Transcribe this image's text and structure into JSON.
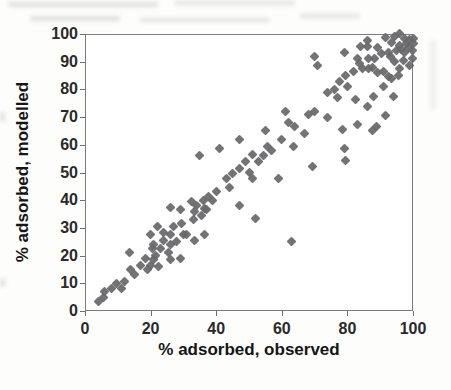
{
  "figure": {
    "kind": "scanned scatter chart"
  },
  "chart_data": {
    "type": "scatter",
    "title": "",
    "xlabel": "% adsorbed, observed",
    "ylabel": "% adsorbed, modelled",
    "xlim": [
      0,
      100
    ],
    "ylim": [
      0,
      100
    ],
    "x_ticks": [
      0,
      20,
      40,
      60,
      80,
      100
    ],
    "y_ticks": [
      0,
      10,
      20,
      30,
      40,
      50,
      60,
      70,
      80,
      90,
      100
    ],
    "grid": false,
    "legend": false,
    "marker": "diamond",
    "marker_color": "#68686c",
    "axis_color": "#6f6f6f",
    "points": [
      [
        4,
        3.5
      ],
      [
        5.5,
        5
      ],
      [
        6,
        7
      ],
      [
        8,
        8
      ],
      [
        9.5,
        10
      ],
      [
        11,
        8
      ],
      [
        12,
        10.5
      ],
      [
        13.5,
        21
      ],
      [
        14,
        15
      ],
      [
        15,
        13
      ],
      [
        17,
        16.5
      ],
      [
        19,
        15
      ],
      [
        20,
        16.5
      ],
      [
        18.5,
        19
      ],
      [
        20.5,
        22.5
      ],
      [
        21,
        18.5
      ],
      [
        21,
        24
      ],
      [
        21.5,
        20
      ],
      [
        22.5,
        16
      ],
      [
        23,
        22.5
      ],
      [
        24,
        25.5
      ],
      [
        25.5,
        21
      ],
      [
        26,
        27.5
      ],
      [
        26,
        24
      ],
      [
        28,
        25
      ],
      [
        30,
        27.5
      ],
      [
        29,
        19
      ],
      [
        26,
        18.5
      ],
      [
        20,
        27.5
      ],
      [
        22,
        30.5
      ],
      [
        24,
        28.5
      ],
      [
        27,
        30.5
      ],
      [
        29.5,
        31.5
      ],
      [
        31,
        27.5
      ],
      [
        33,
        33
      ],
      [
        33.5,
        25.5
      ],
      [
        35.5,
        34.5
      ],
      [
        36.5,
        27.5
      ],
      [
        37,
        36.5
      ],
      [
        26,
        37.5
      ],
      [
        29,
        36.5
      ],
      [
        32.5,
        39.5
      ],
      [
        33.5,
        36
      ],
      [
        34,
        38
      ],
      [
        36,
        40
      ],
      [
        36.5,
        37
      ],
      [
        37.5,
        41.5
      ],
      [
        39,
        40
      ],
      [
        40,
        43
      ],
      [
        43,
        48
      ],
      [
        44,
        44.5
      ],
      [
        45,
        49.5
      ],
      [
        47,
        38
      ],
      [
        47,
        51.5
      ],
      [
        49,
        54
      ],
      [
        50,
        50
      ],
      [
        51,
        48
      ],
      [
        51,
        56.5
      ],
      [
        52,
        33.5
      ],
      [
        53,
        54
      ],
      [
        54.5,
        56
      ],
      [
        55,
        65
      ],
      [
        55.5,
        59.5
      ],
      [
        57,
        58
      ],
      [
        59,
        48
      ],
      [
        60,
        62
      ],
      [
        63.5,
        59.5
      ],
      [
        35,
        56
      ],
      [
        41,
        58.5
      ],
      [
        47,
        62
      ],
      [
        63,
        25
      ],
      [
        61,
        72
      ],
      [
        62,
        68
      ],
      [
        64,
        66.5
      ],
      [
        67,
        64
      ],
      [
        69.5,
        52
      ],
      [
        78.5,
        65.5
      ],
      [
        79,
        58.5
      ],
      [
        79.5,
        54.5
      ],
      [
        87.5,
        65
      ],
      [
        68,
        71
      ],
      [
        70,
        72
      ],
      [
        73.8,
        70
      ],
      [
        74,
        79
      ],
      [
        76,
        80
      ],
      [
        77,
        77
      ],
      [
        77.5,
        83
      ],
      [
        79.5,
        85
      ],
      [
        80,
        81
      ],
      [
        82,
        86.5
      ],
      [
        82.5,
        76.5
      ],
      [
        83,
        67.5
      ],
      [
        84.5,
        87.5
      ],
      [
        86,
        74
      ],
      [
        88,
        77.5
      ],
      [
        89,
        66.5
      ],
      [
        91.5,
        70.5
      ],
      [
        91,
        81
      ],
      [
        92.5,
        84.5
      ],
      [
        94,
        77.5
      ],
      [
        95.5,
        85
      ],
      [
        91,
        86.5
      ],
      [
        70,
        92
      ],
      [
        71,
        88.5
      ],
      [
        79,
        93.5
      ],
      [
        83,
        91
      ],
      [
        84,
        95.5
      ],
      [
        86,
        95.5
      ],
      [
        86.5,
        91
      ],
      [
        87.5,
        88
      ],
      [
        83.8,
        89.5
      ],
      [
        86.3,
        87.7
      ],
      [
        89.3,
        86.2
      ],
      [
        93,
        91.7
      ],
      [
        93.5,
        84.1
      ],
      [
        96,
        87.7
      ],
      [
        99,
        88.8
      ],
      [
        86,
        97.8
      ],
      [
        88.4,
        91.3
      ],
      [
        89.3,
        95.3
      ],
      [
        90.5,
        93
      ],
      [
        91.5,
        98.9
      ],
      [
        92.4,
        93.5
      ],
      [
        93.5,
        97.1
      ],
      [
        94.5,
        99
      ],
      [
        95,
        93.9
      ],
      [
        96,
        100.3
      ],
      [
        96,
        96
      ],
      [
        96.5,
        94.5
      ],
      [
        97.5,
        98.5
      ],
      [
        97.5,
        93.5
      ],
      [
        98.1,
        96.4
      ],
      [
        98.5,
        95
      ],
      [
        99,
        98
      ],
      [
        99.7,
        91
      ],
      [
        99.7,
        93.9
      ],
      [
        100,
        96.5
      ],
      [
        100,
        98.3
      ],
      [
        97,
        90.3
      ],
      [
        94.5,
        89.9
      ]
    ]
  }
}
